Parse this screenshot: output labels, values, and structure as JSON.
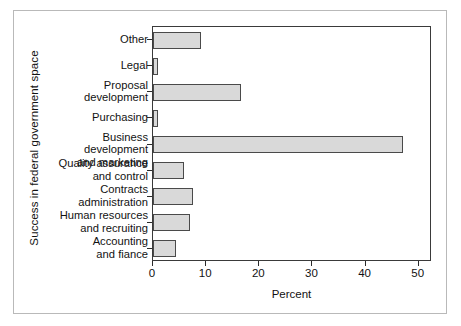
{
  "chart_data": {
    "type": "bar",
    "orientation": "horizontal",
    "title": "",
    "xlabel": "Percent",
    "ylabel": "Success in federal government space",
    "xlim": [
      0,
      52.5
    ],
    "xticks": [
      "0",
      "10",
      "20",
      "30",
      "40",
      "50"
    ],
    "xtick_values": [
      0,
      10,
      20,
      30,
      40,
      50
    ],
    "grid": false,
    "legend": null,
    "categories": [
      "Other",
      "Legal",
      "Proposal\ndevelopment",
      "Purchasing",
      "Business development\nand marketing",
      "Quality assurance\nand control",
      "Contracts\nadministration",
      "Human resources\nand recruiting",
      "Accounting\nand fiance"
    ],
    "values": [
      9,
      1,
      16.5,
      1,
      47,
      5.8,
      7.5,
      7,
      4.3
    ],
    "bar_fill_color": "#d9d9d9",
    "bar_edge_color": "#4a4a4a",
    "axis_color": "#3a3a3a",
    "frame_color": "#b9b9b9",
    "background_color": "#ffffff"
  }
}
